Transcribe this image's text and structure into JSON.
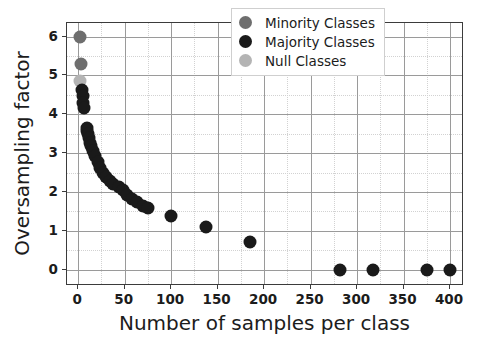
{
  "chart_data": {
    "type": "scatter",
    "title": "",
    "xlabel": "Number of samples per class",
    "ylabel": "Oversampling factor",
    "xlim": [
      -12,
      415
    ],
    "ylim": [
      -0.42,
      6.35
    ],
    "xticks": [
      0,
      50,
      100,
      150,
      200,
      250,
      300,
      350,
      400
    ],
    "yticks": [
      0,
      1,
      2,
      3,
      4,
      5,
      6
    ],
    "xtick_labels": [
      "0",
      "50",
      "100",
      "150",
      "200",
      "250",
      "300",
      "350",
      "400"
    ],
    "ytick_labels": [
      "0",
      "1",
      "2",
      "3",
      "4",
      "5",
      "6"
    ],
    "x_minor_step": 25,
    "y_minor_step": 0.5,
    "grid": true,
    "grid_minor": true,
    "legend_position": "upper right",
    "marker_size_px": 13,
    "colors": {
      "minority": "#6e6e6e",
      "majority": "#1a1a1a",
      "null": "#b4b4b4",
      "grid_major": "#9a9a9a",
      "grid_minor": "#d2d2d2",
      "axis": "#3b3b3b",
      "text": "#1c1c1c",
      "background": "#ffffff"
    },
    "series": [
      {
        "name": "Null Classes",
        "color_key": "null",
        "points": [
          [
            2,
            4.85
          ]
        ]
      },
      {
        "name": "Minority Classes",
        "color_key": "minority",
        "points": [
          [
            2,
            6.0
          ],
          [
            3,
            5.3
          ]
        ]
      },
      {
        "name": "Majority Classes",
        "color_key": "majority",
        "points": [
          [
            4,
            4.62
          ],
          [
            5,
            4.47
          ],
          [
            5,
            4.3
          ],
          [
            6,
            4.15
          ],
          [
            9,
            3.66
          ],
          [
            10,
            3.58
          ],
          [
            11,
            3.5
          ],
          [
            12,
            3.38
          ],
          [
            13,
            3.27
          ],
          [
            14,
            3.18
          ],
          [
            16,
            3.05
          ],
          [
            18,
            2.93
          ],
          [
            21,
            2.78
          ],
          [
            24,
            2.62
          ],
          [
            27,
            2.5
          ],
          [
            30,
            2.38
          ],
          [
            34,
            2.28
          ],
          [
            38,
            2.2
          ],
          [
            44,
            2.12
          ],
          [
            48,
            2.06
          ],
          [
            53,
            1.92
          ],
          [
            58,
            1.83
          ],
          [
            63,
            1.74
          ],
          [
            70,
            1.63
          ],
          [
            75,
            1.58
          ],
          [
            100,
            1.39
          ],
          [
            137,
            1.1
          ],
          [
            185,
            0.71
          ],
          [
            282,
            0.0
          ],
          [
            317,
            0.0
          ],
          [
            375,
            0.0
          ],
          [
            400,
            0.0
          ]
        ]
      }
    ]
  },
  "legend": {
    "entries": [
      {
        "label": "Minority Classes",
        "color_key": "minority"
      },
      {
        "label": "Majority Classes",
        "color_key": "majority"
      },
      {
        "label": "Null Classes",
        "color_key": "null"
      }
    ]
  }
}
